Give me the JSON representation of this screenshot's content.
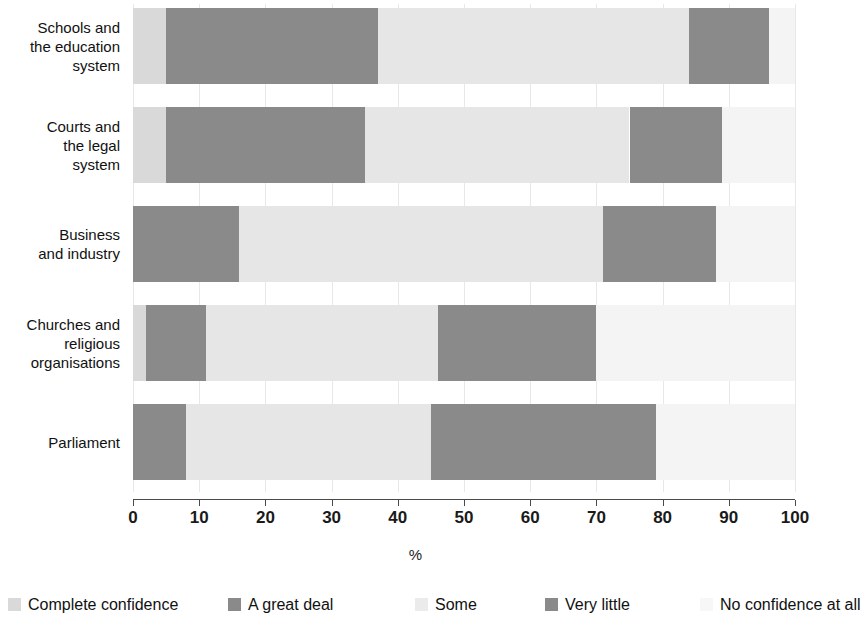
{
  "chart_data": {
    "type": "bar",
    "orientation": "horizontal",
    "stacked": true,
    "stack_mode": "absolute-percent",
    "title": "",
    "subtitle": "",
    "xlabel": "%",
    "ylabel": "",
    "xlim": [
      0,
      100
    ],
    "xticks": [
      0,
      10,
      20,
      30,
      40,
      50,
      60,
      70,
      80,
      90,
      100
    ],
    "xtick_labels": [
      "0",
      "10",
      "20",
      "30",
      "40",
      "50",
      "60",
      "70",
      "80",
      "90",
      "100"
    ],
    "grid": true,
    "grid_axis": "x",
    "legend_position": "bottom",
    "categories": [
      "Schools and\nthe education\nsystem",
      "Courts and\nthe legal\nsystem",
      "Business\nand industry",
      "Churches and\nreligious\norganisations",
      "Parliament"
    ],
    "series": [
      {
        "name": "Complete confidence",
        "color": "#d9d9d9",
        "values": [
          5,
          5,
          0,
          2,
          0
        ]
      },
      {
        "name": "A great deal",
        "color": "#8a8a8a",
        "values": [
          32,
          30,
          16,
          9,
          8
        ]
      },
      {
        "name": "Some",
        "color": "#e6e6e6",
        "values": [
          47,
          40,
          55,
          35,
          37
        ]
      },
      {
        "name": "Very little",
        "color": "#8a8a8a",
        "values": [
          12,
          14,
          17,
          24,
          34
        ]
      },
      {
        "name": "No confidence at all",
        "color": "#f4f4f4",
        "values": [
          4,
          11,
          12,
          30,
          21
        ]
      }
    ],
    "annotations": []
  },
  "axis": {
    "x_title": "%"
  },
  "legend": {
    "items": [
      {
        "label": "Complete confidence",
        "color": "#d9d9d9"
      },
      {
        "label": "A great deal",
        "color": "#8a8a8a"
      },
      {
        "label": "Some",
        "color": "#ebebeb"
      },
      {
        "label": "Very little",
        "color": "#8a8a8a"
      },
      {
        "label": "No confidence at all",
        "color": "#f7f7f7"
      }
    ]
  }
}
